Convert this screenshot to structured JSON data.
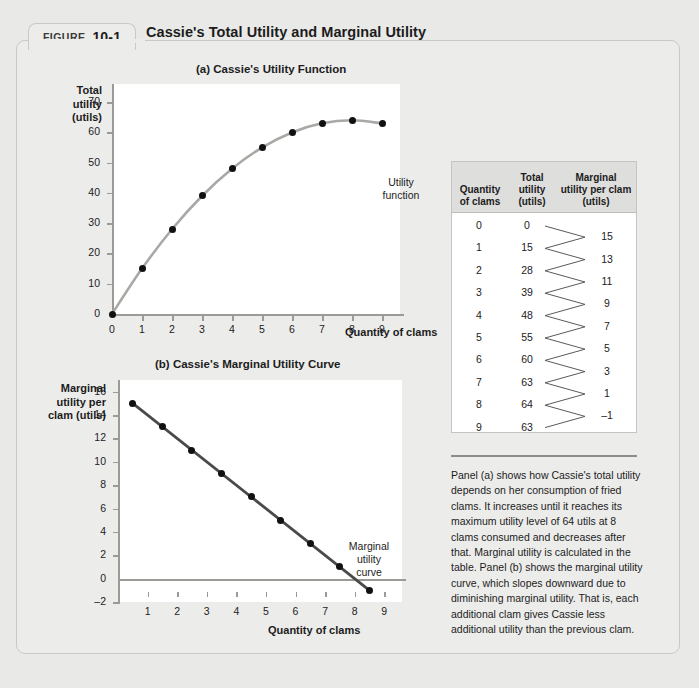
{
  "figure": {
    "label_word": "FIGURE",
    "number": "10-1",
    "title": "Cassie's Total Utility and Marginal Utility"
  },
  "panel_a": {
    "title": "(a) Cassie's Utility Function",
    "y_axis_name": "Total\nutility\n(utils)",
    "y_axis_lines": [
      "Total",
      "utility",
      "(utils)"
    ],
    "x_axis_name": "Quantity of clams",
    "curve_label_lines": [
      "Utility",
      "function"
    ],
    "y_ticks": [
      0,
      10,
      20,
      30,
      40,
      50,
      60,
      70
    ],
    "x_ticks": [
      0,
      1,
      2,
      3,
      4,
      5,
      6,
      7,
      8,
      9
    ]
  },
  "panel_b": {
    "title": "(b) Cassie's Marginal Utility Curve",
    "y_axis_lines": [
      "Marginal",
      "utility per",
      "clam (utils)"
    ],
    "x_axis_name": "Quantity of clams",
    "curve_label_lines": [
      "Marginal",
      "utility",
      "curve"
    ],
    "y_ticks": [
      -2,
      0,
      2,
      4,
      6,
      8,
      10,
      12,
      14,
      16
    ],
    "x_ticks": [
      1,
      2,
      3,
      4,
      5,
      6,
      7,
      8,
      9
    ]
  },
  "table": {
    "headers": {
      "quantity_lines": [
        "Quantity",
        "of clams"
      ],
      "total_lines": [
        "Total",
        "utility",
        "(utils)"
      ],
      "marginal_lines": [
        "Marginal",
        "utility per clam",
        "(utils)"
      ]
    },
    "quantity": [
      "0",
      "1",
      "2",
      "3",
      "4",
      "5",
      "6",
      "7",
      "8",
      "9"
    ],
    "total_utility": [
      "0",
      "15",
      "28",
      "39",
      "48",
      "55",
      "60",
      "63",
      "64",
      "63"
    ],
    "marginal_utility": [
      "15",
      "13",
      "11",
      "9",
      "7",
      "5",
      "3",
      "1",
      "-1"
    ]
  },
  "caption": "Panel (a) shows how Cassie's total utility depends on her consumption of fried clams. It increases until it reaches its maximum utility level of 64 utils at 8 clams consumed and decreases after that. Marginal utility is calculated in the table. Panel (b) shows the marginal utility curve, which slopes downward due to diminishing marginal utility. That is, each additional clam gives Cassie less additional utility than the previous clam.",
  "colors": {
    "page_background": "#e9e9e7",
    "figure_background": "#ececeb",
    "plot_background": "#ffffff",
    "axis": "#9a9a97",
    "total_utility_curve": "#a8a8a5",
    "marginal_utility_curve": "#4a4a48",
    "data_point": "#111111",
    "table_header_background": "#dededc"
  },
  "chart_data": [
    {
      "type": "line",
      "panel": "a",
      "title": "(a) Cassie's Utility Function",
      "xlabel": "Quantity of clams",
      "ylabel": "Total utility (utils)",
      "x": [
        0,
        1,
        2,
        3,
        4,
        5,
        6,
        7,
        8,
        9
      ],
      "values": [
        0,
        15,
        28,
        39,
        48,
        55,
        60,
        63,
        64,
        63
      ],
      "series": [
        {
          "name": "Utility function",
          "values": [
            0,
            15,
            28,
            39,
            48,
            55,
            60,
            63,
            64,
            63
          ]
        }
      ],
      "xlim": [
        0,
        9.6
      ],
      "ylim": [
        0,
        76
      ],
      "yticks": [
        0,
        10,
        20,
        30,
        40,
        50,
        60,
        70
      ],
      "xticks": [
        0,
        1,
        2,
        3,
        4,
        5,
        6,
        7,
        8,
        9
      ],
      "grid": false,
      "legend": "none",
      "annotations": [
        "Utility function"
      ]
    },
    {
      "type": "line",
      "panel": "b",
      "title": "(b) Cassie's Marginal Utility Curve",
      "xlabel": "Quantity of clams",
      "ylabel": "Marginal utility per clam (utils)",
      "x": [
        0.5,
        1.5,
        2.5,
        3.5,
        4.5,
        5.5,
        6.5,
        7.5,
        8.5
      ],
      "values": [
        15,
        13,
        11,
        9,
        7,
        5,
        3,
        1,
        -1
      ],
      "series": [
        {
          "name": "Marginal utility curve",
          "values": [
            15,
            13,
            11,
            9,
            7,
            5,
            3,
            1,
            -1
          ]
        }
      ],
      "xlim": [
        0,
        9.6
      ],
      "ylim": [
        -2,
        17
      ],
      "yticks": [
        -2,
        0,
        2,
        4,
        6,
        8,
        10,
        12,
        14,
        16
      ],
      "xticks": [
        1,
        2,
        3,
        4,
        5,
        6,
        7,
        8,
        9
      ],
      "grid": false,
      "legend": "none",
      "annotations": [
        "Marginal utility curve"
      ]
    }
  ]
}
